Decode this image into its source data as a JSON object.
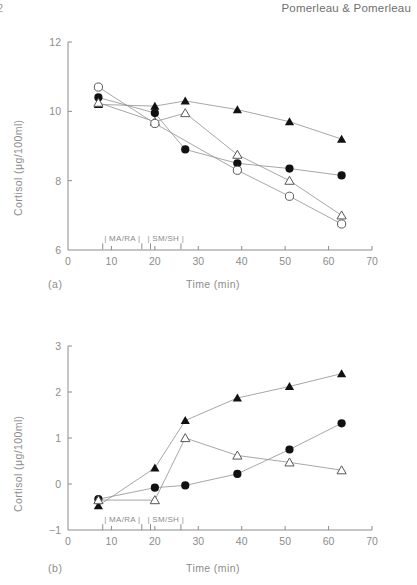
{
  "header": {
    "folio": "2",
    "running_head": "Pomerleau & Pomerleau"
  },
  "panels": [
    {
      "id": "a",
      "caption": "(a)",
      "xlabel": "Time (min)",
      "ylabel": "Cortisol (μg/100ml)"
    },
    {
      "id": "b",
      "caption": "(b)",
      "xlabel": "Time (min)",
      "ylabel": "Cortisol (μg/100ml)"
    }
  ],
  "annotations": {
    "ma_ra": "| MA/RA |",
    "sm_sh": "| SM/SH |"
  },
  "chart_data": [
    {
      "type": "line",
      "panel": "(a)",
      "title": "",
      "xlabel": "Time (min)",
      "ylabel": "Cortisol (μg/100ml)",
      "xlim": [
        0,
        70
      ],
      "ylim": [
        6,
        12
      ],
      "xticks": [
        0,
        10,
        20,
        30,
        40,
        50,
        60,
        70
      ],
      "yticks": [
        6,
        8,
        10,
        12
      ],
      "grid": false,
      "legend": "none",
      "annotations": [
        {
          "text": "| MA/RA |",
          "x_start": 8,
          "x_end": 17,
          "y": 6.25
        },
        {
          "text": "| SM/SH |",
          "x_start": 19,
          "x_end": 26,
          "y": 6.25
        }
      ],
      "series": [
        {
          "name": "filled-triangle",
          "marker": "filled-triangle",
          "x": [
            7,
            20,
            27,
            39,
            51,
            63
          ],
          "values": [
            10.2,
            10.15,
            10.3,
            10.05,
            9.7,
            9.2
          ]
        },
        {
          "name": "filled-circle",
          "marker": "filled-circle",
          "x": [
            7,
            20,
            27,
            39,
            51,
            63
          ],
          "values": [
            10.4,
            9.95,
            8.9,
            8.5,
            8.35,
            8.15
          ]
        },
        {
          "name": "open-triangle",
          "marker": "open-triangle",
          "x": [
            7,
            20,
            27,
            39,
            51,
            63
          ],
          "values": [
            10.25,
            9.7,
            9.95,
            8.75,
            8.0,
            7.0
          ]
        },
        {
          "name": "open-circle",
          "marker": "open-circle",
          "x": [
            7,
            20,
            39,
            51,
            63
          ],
          "values": [
            10.7,
            9.65,
            8.3,
            7.55,
            6.75
          ]
        }
      ]
    },
    {
      "type": "line",
      "panel": "(b)",
      "title": "",
      "xlabel": "Time (min)",
      "ylabel": "Cortisol (μg/100ml)",
      "xlim": [
        0,
        70
      ],
      "ylim": [
        -1,
        3
      ],
      "xticks": [
        0,
        10,
        20,
        30,
        40,
        50,
        60,
        70
      ],
      "yticks": [
        -1,
        0,
        1,
        2,
        3
      ],
      "grid": false,
      "legend": "none",
      "annotations": [
        {
          "text": "| MA/RA |",
          "x_start": 8,
          "x_end": 17,
          "y": -0.83
        },
        {
          "text": "| SM/SH |",
          "x_start": 19,
          "x_end": 26,
          "y": -0.83
        }
      ],
      "series": [
        {
          "name": "filled-triangle",
          "marker": "filled-triangle",
          "x": [
            7,
            20,
            27,
            39,
            51,
            63
          ],
          "values": [
            -0.47,
            0.35,
            1.38,
            1.87,
            2.12,
            2.4
          ]
        },
        {
          "name": "filled-circle",
          "marker": "filled-circle",
          "x": [
            7,
            20,
            27,
            39,
            51,
            63
          ],
          "values": [
            -0.33,
            -0.08,
            -0.03,
            0.22,
            0.75,
            1.32
          ]
        },
        {
          "name": "open-triangle",
          "marker": "open-triangle",
          "x": [
            7,
            20,
            27,
            39,
            51,
            63
          ],
          "values": [
            -0.35,
            -0.35,
            1.0,
            0.62,
            0.47,
            0.3
          ]
        }
      ]
    }
  ]
}
